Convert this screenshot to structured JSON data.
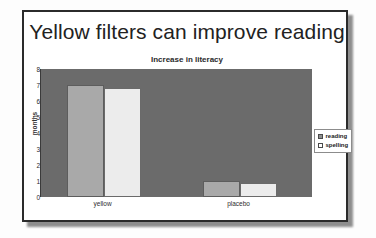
{
  "slide": {
    "title": "Yellow filters can improve reading"
  },
  "chart_data": {
    "type": "bar",
    "title": "Increase in literacy",
    "xlabel": "",
    "ylabel": "months",
    "ylim": [
      0,
      8
    ],
    "yticks": [
      8,
      7,
      6,
      5,
      4,
      3,
      2,
      1,
      0
    ],
    "grid": false,
    "legend_position": "right",
    "categories": [
      "yellow",
      "placebo"
    ],
    "series": [
      {
        "name": "reading",
        "values": [
          7.0,
          1.0
        ]
      },
      {
        "name": "spelling",
        "values": [
          6.8,
          0.85
        ]
      }
    ],
    "colors": {
      "plot_background": "#6b6b6b",
      "reading": "#a9a9a9",
      "spelling": "#ececec",
      "frame": "#2b2b2b"
    }
  }
}
